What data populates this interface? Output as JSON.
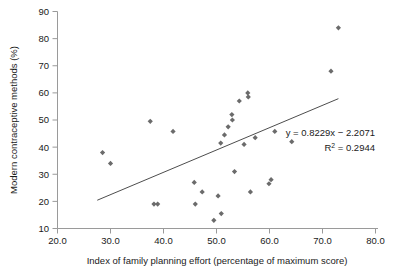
{
  "chart_data": {
    "type": "scatter",
    "title": "",
    "xlabel": "Index of family planning effort (percentage of maximum score)",
    "ylabel": "Modern contraceptive methods (%)",
    "xlim": [
      20.0,
      80.0
    ],
    "ylim": [
      10,
      90
    ],
    "xticks": [
      "20.0",
      "30.0",
      "40.0",
      "50.0",
      "60.0",
      "70.0",
      "80.0"
    ],
    "xtick_values": [
      20,
      30,
      40,
      50,
      60,
      70,
      80
    ],
    "yticks": [
      "10",
      "20",
      "30",
      "40",
      "50",
      "60",
      "70",
      "80",
      "90"
    ],
    "ytick_values": [
      10,
      20,
      30,
      40,
      50,
      60,
      70,
      80,
      90
    ],
    "grid": false,
    "legend": "none",
    "marker": "diamond",
    "marker_color": "#6b6b6b",
    "trendline_color": "#4d4d4d",
    "points": [
      {
        "x": 28.5,
        "y": 38.0
      },
      {
        "x": 30.0,
        "y": 34.0
      },
      {
        "x": 37.5,
        "y": 49.5
      },
      {
        "x": 38.2,
        "y": 19.0
      },
      {
        "x": 38.9,
        "y": 19.0
      },
      {
        "x": 41.8,
        "y": 45.8
      },
      {
        "x": 45.8,
        "y": 27.0
      },
      {
        "x": 46.0,
        "y": 19.0
      },
      {
        "x": 47.3,
        "y": 23.5
      },
      {
        "x": 49.5,
        "y": 13.0
      },
      {
        "x": 50.3,
        "y": 22.0
      },
      {
        "x": 50.8,
        "y": 41.5
      },
      {
        "x": 50.9,
        "y": 15.5
      },
      {
        "x": 51.5,
        "y": 44.5
      },
      {
        "x": 52.2,
        "y": 47.5
      },
      {
        "x": 52.9,
        "y": 52.0
      },
      {
        "x": 53.0,
        "y": 50.0
      },
      {
        "x": 53.4,
        "y": 31.0
      },
      {
        "x": 54.3,
        "y": 57.0
      },
      {
        "x": 55.2,
        "y": 41.0
      },
      {
        "x": 55.9,
        "y": 60.0
      },
      {
        "x": 56.0,
        "y": 58.5
      },
      {
        "x": 56.4,
        "y": 23.5
      },
      {
        "x": 57.3,
        "y": 43.5
      },
      {
        "x": 59.9,
        "y": 26.5
      },
      {
        "x": 60.3,
        "y": 28.0
      },
      {
        "x": 61.0,
        "y": 45.8
      },
      {
        "x": 64.2,
        "y": 42.0
      },
      {
        "x": 71.6,
        "y": 68.0
      },
      {
        "x": 73.0,
        "y": 84.0
      }
    ],
    "trendline": {
      "equation": "y = 0.8229x − 2.2071",
      "r_squared_label": "R",
      "r_squared_sup": "2",
      "r_squared_value": "= 0.2944",
      "slope": 0.8229,
      "intercept": -2.2071,
      "r2": 0.2944,
      "x_start": 27.5,
      "x_end": 73.0
    }
  }
}
